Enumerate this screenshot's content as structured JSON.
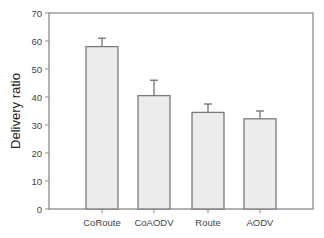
{
  "chart_data": {
    "type": "bar",
    "title": "",
    "xlabel": "",
    "ylabel": "Delivery ratio",
    "ylim": [
      0,
      70
    ],
    "yticks": [
      0,
      10,
      20,
      30,
      40,
      50,
      60,
      70
    ],
    "grid": false,
    "legend": null,
    "categories": [
      "CoRoute",
      "CoAODV",
      "Route",
      "AODV"
    ],
    "values": [
      58,
      40.5,
      34.5,
      32.2
    ],
    "error_bars_upper": [
      3,
      5.5,
      3,
      2.8
    ],
    "colors": {
      "bar_fill": "#ececec",
      "bar_edge": "#7a7a7a",
      "axis": "#8a8a8a"
    }
  }
}
